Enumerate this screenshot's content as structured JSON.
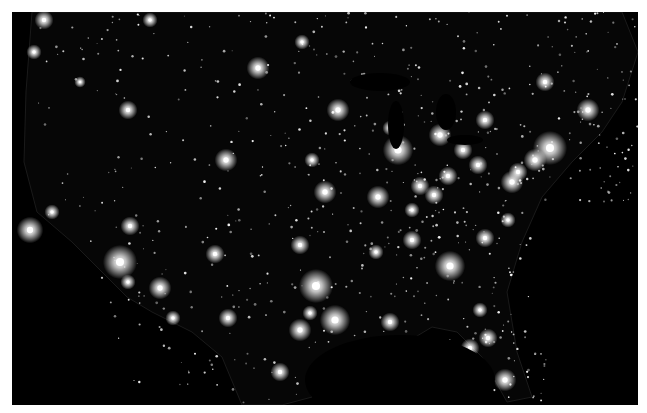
{
  "image": {
    "subject": "Continental United States at night (city lights)",
    "background_color": "#000000",
    "frame_color": "#ffffff",
    "light_color": "#ffffff",
    "map_bounds": {
      "x": 12,
      "y": 12,
      "width": 626,
      "height": 393
    }
  },
  "cities": [
    {
      "name": "Seattle",
      "x": 44,
      "y": 20,
      "r": 5
    },
    {
      "name": "Portland",
      "x": 34,
      "y": 52,
      "r": 4
    },
    {
      "name": "San Francisco Bay",
      "x": 30,
      "y": 230,
      "r": 7
    },
    {
      "name": "Sacramento",
      "x": 52,
      "y": 212,
      "r": 4
    },
    {
      "name": "Los Angeles",
      "x": 120,
      "y": 262,
      "r": 9
    },
    {
      "name": "San Diego",
      "x": 128,
      "y": 282,
      "r": 4
    },
    {
      "name": "Las Vegas",
      "x": 130,
      "y": 226,
      "r": 5
    },
    {
      "name": "Phoenix",
      "x": 160,
      "y": 288,
      "r": 6
    },
    {
      "name": "Tucson",
      "x": 173,
      "y": 318,
      "r": 4
    },
    {
      "name": "Salt Lake City",
      "x": 128,
      "y": 110,
      "r": 5
    },
    {
      "name": "Boise",
      "x": 80,
      "y": 82,
      "r": 3
    },
    {
      "name": "Denver",
      "x": 226,
      "y": 160,
      "r": 6
    },
    {
      "name": "Albuquerque",
      "x": 215,
      "y": 254,
      "r": 5
    },
    {
      "name": "El Paso",
      "x": 228,
      "y": 318,
      "r": 5
    },
    {
      "name": "Minneapolis",
      "x": 338,
      "y": 110,
      "r": 6
    },
    {
      "name": "Chicago",
      "x": 398,
      "y": 150,
      "r": 8
    },
    {
      "name": "Detroit",
      "x": 440,
      "y": 135,
      "r": 6
    },
    {
      "name": "Milwaukee",
      "x": 390,
      "y": 128,
      "r": 4
    },
    {
      "name": "St. Louis",
      "x": 378,
      "y": 197,
      "r": 6
    },
    {
      "name": "Kansas City",
      "x": 325,
      "y": 192,
      "r": 6
    },
    {
      "name": "Indianapolis",
      "x": 420,
      "y": 186,
      "r": 5
    },
    {
      "name": "Columbus",
      "x": 448,
      "y": 176,
      "r": 5
    },
    {
      "name": "Cleveland",
      "x": 463,
      "y": 150,
      "r": 5
    },
    {
      "name": "Pittsburgh",
      "x": 478,
      "y": 165,
      "r": 5
    },
    {
      "name": "Cincinnati",
      "x": 434,
      "y": 195,
      "r": 5
    },
    {
      "name": "Louisville",
      "x": 412,
      "y": 210,
      "r": 4
    },
    {
      "name": "Nashville",
      "x": 412,
      "y": 240,
      "r": 5
    },
    {
      "name": "Memphis",
      "x": 376,
      "y": 252,
      "r": 4
    },
    {
      "name": "Atlanta",
      "x": 450,
      "y": 266,
      "r": 8
    },
    {
      "name": "Charlotte",
      "x": 485,
      "y": 238,
      "r": 5
    },
    {
      "name": "Raleigh",
      "x": 508,
      "y": 220,
      "r": 4
    },
    {
      "name": "Washington DC",
      "x": 512,
      "y": 182,
      "r": 6
    },
    {
      "name": "Baltimore",
      "x": 518,
      "y": 172,
      "r": 5
    },
    {
      "name": "Philadelphia",
      "x": 535,
      "y": 160,
      "r": 6
    },
    {
      "name": "New York",
      "x": 550,
      "y": 148,
      "r": 9
    },
    {
      "name": "Boston",
      "x": 588,
      "y": 110,
      "r": 6
    },
    {
      "name": "Montreal",
      "x": 545,
      "y": 82,
      "r": 5
    },
    {
      "name": "Toronto",
      "x": 485,
      "y": 120,
      "r": 5
    },
    {
      "name": "Dallas",
      "x": 316,
      "y": 286,
      "r": 9
    },
    {
      "name": "Houston",
      "x": 335,
      "y": 320,
      "r": 8
    },
    {
      "name": "San Antonio",
      "x": 300,
      "y": 330,
      "r": 6
    },
    {
      "name": "Austin",
      "x": 310,
      "y": 313,
      "r": 4
    },
    {
      "name": "Oklahoma City",
      "x": 300,
      "y": 245,
      "r": 5
    },
    {
      "name": "New Orleans",
      "x": 390,
      "y": 322,
      "r": 5
    },
    {
      "name": "Jacksonville",
      "x": 480,
      "y": 310,
      "r": 4
    },
    {
      "name": "Orlando",
      "x": 488,
      "y": 338,
      "r": 5
    },
    {
      "name": "Tampa",
      "x": 470,
      "y": 348,
      "r": 5
    },
    {
      "name": "Miami",
      "x": 505,
      "y": 380,
      "r": 6
    },
    {
      "name": "Monterrey",
      "x": 280,
      "y": 372,
      "r": 5
    },
    {
      "name": "Omaha",
      "x": 312,
      "y": 160,
      "r": 4
    },
    {
      "name": "Winnipeg",
      "x": 302,
      "y": 42,
      "r": 4
    },
    {
      "name": "Calgary",
      "x": 150,
      "y": 20,
      "r": 4
    },
    {
      "name": "Bakken",
      "x": 258,
      "y": 68,
      "r": 6
    }
  ],
  "water_bodies": [
    {
      "name": "Lake Michigan",
      "cx": 396,
      "cy": 125,
      "rx": 8,
      "ry": 24
    },
    {
      "name": "Lake Superior",
      "cx": 380,
      "cy": 82,
      "rx": 30,
      "ry": 9
    },
    {
      "name": "Lake Huron",
      "cx": 446,
      "cy": 112,
      "rx": 10,
      "ry": 18
    },
    {
      "name": "Lake Erie",
      "cx": 465,
      "cy": 140,
      "rx": 18,
      "ry": 5
    },
    {
      "name": "Gulf of Mexico",
      "cx": 400,
      "cy": 380,
      "rx": 95,
      "ry": 45
    }
  ]
}
